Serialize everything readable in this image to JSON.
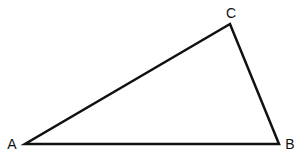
{
  "diagram": {
    "type": "triangle",
    "stroke_color": "#111111",
    "stroke_width": 2.5,
    "vertices": [
      {
        "label": "A",
        "x": 25,
        "y": 144,
        "label_x": 12,
        "label_y": 149
      },
      {
        "label": "B",
        "x": 279,
        "y": 144,
        "label_x": 290,
        "label_y": 149
      },
      {
        "label": "C",
        "x": 230,
        "y": 24,
        "label_x": 231,
        "label_y": 18
      }
    ],
    "edges": [
      [
        "A",
        "B"
      ],
      [
        "B",
        "C"
      ],
      [
        "C",
        "A"
      ]
    ]
  }
}
